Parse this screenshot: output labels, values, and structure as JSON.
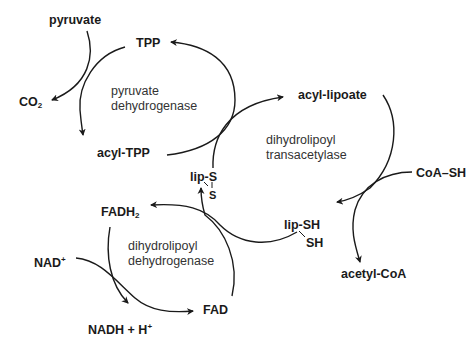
{
  "cycles": [
    {
      "enzyme": [
        "pyruvate",
        "dehydrogenase"
      ],
      "metabolites": {
        "pyruvate": "pyruvate",
        "tpp": "TPP",
        "co2_main": "CO",
        "co2_sub": "2",
        "acyl_tpp": "acyl-TPP"
      }
    },
    {
      "enzyme": [
        "dihydrolipoyl",
        "transacetylase"
      ],
      "metabolites": {
        "acyl_lipoate": "acyl-lipoate",
        "coa_sh": "CoA–SH",
        "lip_sh": "lip-SH",
        "sh": "SH",
        "acetyl_coa": "acetyl-CoA"
      }
    },
    {
      "enzyme": [
        "dihydrolipoyl",
        "dehydrogenase"
      ],
      "metabolites": {
        "lip_s": "lip-S",
        "s": "S",
        "fadh_main": "FADH",
        "fadh_sub": "2",
        "nad_main": "NAD",
        "nad_sup": "+",
        "fad": "FAD",
        "nadh_main": "NADH + H",
        "nadh_sup": "+"
      }
    }
  ],
  "colors": {
    "stroke": "#1a1a1a",
    "background": "#ffffff"
  }
}
